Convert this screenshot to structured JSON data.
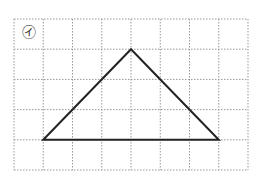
{
  "diagram": {
    "label": "㋑",
    "grid": {
      "columns": 8,
      "rows": 5,
      "left": 14,
      "top": 19,
      "cell_w": 29.25,
      "cell_h": 30.2,
      "line_color": "#999999"
    },
    "shape": {
      "type": "triangle",
      "vertices_grid": [
        [
          1,
          4
        ],
        [
          4,
          1
        ],
        [
          7,
          4
        ]
      ],
      "stroke": "#222222"
    }
  }
}
